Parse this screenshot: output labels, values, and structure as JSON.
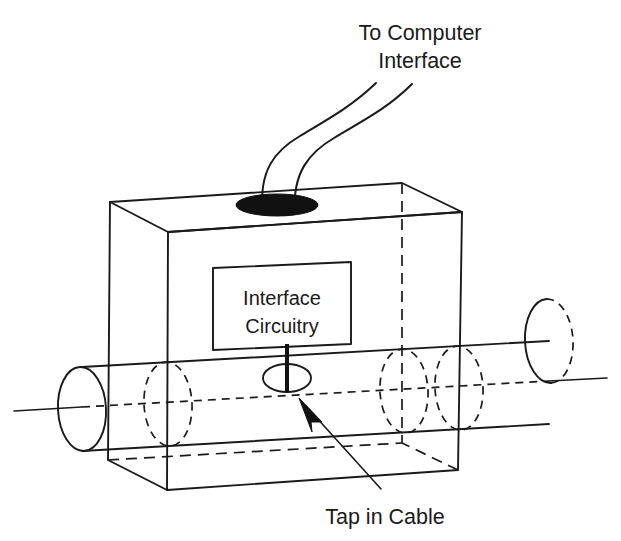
{
  "figure": {
    "kind": "technical-line-diagram",
    "background_color": "#ffffff",
    "line_color": "#1a1a1a"
  },
  "labels": {
    "top_callout": {
      "line1": "To Computer",
      "line2": "Interface"
    },
    "bottom_callout": "Tap in Cable",
    "inner_box": {
      "line1": "Interface",
      "line2": "Circuitry"
    }
  },
  "parts": {
    "enclosure_name": "transceiver-enclosure",
    "inner_box_name": "interface-circuitry-box",
    "cable_name": "coaxial-cable",
    "hole_name": "cable-entry-hole",
    "tap_name": "cable-tap",
    "drop_cable_name": "drop-cable-to-computer"
  },
  "geometry": {
    "enclosure": {
      "front_top_left": [
        168,
        232
      ],
      "front_top_right": [
        462,
        212
      ],
      "front_bottom_left": [
        167,
        490
      ],
      "front_bottom_right": [
        458,
        470
      ],
      "back_top_left": [
        110,
        202
      ],
      "back_top_right": [
        402,
        183
      ],
      "back_bottom_left": [
        108,
        460
      ],
      "back_bottom_right": [
        402,
        443
      ]
    },
    "inner_box": {
      "top_left": [
        213,
        268
      ],
      "top_right": [
        351,
        262
      ],
      "bottom_right": [
        351,
        344
      ],
      "bottom_left": [
        213,
        350
      ]
    },
    "hole_ellipse": {
      "cx": 277,
      "cy": 205,
      "rx": 41,
      "ry": 11
    },
    "cable_axis": {
      "x1": 14,
      "y1": 410,
      "x2": 607,
      "y2": 379
    },
    "tap_ellipse": {
      "cx": 287,
      "cy": 378,
      "rx": 24,
      "ry": 14
    },
    "tap_stem": {
      "x": 287,
      "y1": 344,
      "y2": 392
    },
    "arrow_tip": [
      300,
      400
    ],
    "arrow_tail": [
      381,
      489
    ]
  },
  "colors": {
    "ink": "#1a1a1a",
    "fill_black": "#111111",
    "paper": "#ffffff"
  }
}
